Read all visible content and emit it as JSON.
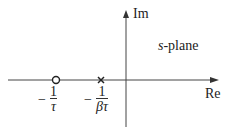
{
  "diagram": {
    "title": "s-plane",
    "title_italic_part": "s",
    "title_rest": "-plane",
    "axes": {
      "imaginary_label": "Im",
      "real_label": "Re"
    },
    "points": [
      {
        "type": "zero",
        "marker": "circle",
        "label_sign": "−",
        "label_num": "1",
        "label_den": "τ"
      },
      {
        "type": "pole",
        "marker": "cross",
        "label_sign": "−",
        "label_num": "1",
        "label_den": "βτ"
      }
    ],
    "colors": {
      "line": "#333333",
      "text": "#222222"
    }
  }
}
